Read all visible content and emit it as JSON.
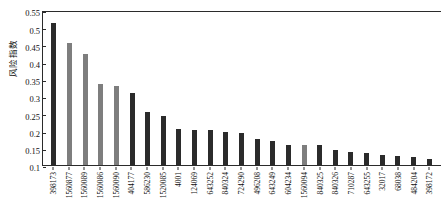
{
  "chart_data": {
    "type": "bar",
    "title": "",
    "xlabel": "",
    "ylabel": "风险指数",
    "ylim": [
      0.1,
      0.55
    ],
    "ybase": 0.1,
    "yticks": [
      0.55,
      0.5,
      0.45,
      0.4,
      0.35,
      0.3,
      0.25,
      0.2,
      0.15,
      0.1
    ],
    "ytick_labels": [
      "0.55",
      "0.5",
      "0.45",
      "0.4",
      "0.35",
      "0.3",
      "0.25",
      "0.2",
      "0.15",
      "0.1"
    ],
    "grid": false,
    "legend": null,
    "categories": [
      "398173",
      "1560877",
      "1560089",
      "1560086",
      "1560090",
      "404177",
      "586230",
      "1520085",
      "4001",
      "124069",
      "643252",
      "840324",
      "724290",
      "496208",
      "643249",
      "604234",
      "1560094",
      "840325",
      "840326",
      "710287",
      "643255",
      "32017",
      "68038",
      "484204",
      "398172"
    ],
    "values": [
      0.512,
      0.455,
      0.421,
      0.335,
      0.329,
      0.31,
      0.253,
      0.243,
      0.205,
      0.203,
      0.203,
      0.197,
      0.192,
      0.175,
      0.17,
      0.158,
      0.157,
      0.157,
      0.143,
      0.137,
      0.134,
      0.13,
      0.127,
      0.122,
      0.117
    ],
    "bar_colors": [
      "dark",
      "gray",
      "gray",
      "gray",
      "gray",
      "dark",
      "dark",
      "dark",
      "dark",
      "dark",
      "dark",
      "dark",
      "dark",
      "dark",
      "dark",
      "dark",
      "gray",
      "dark",
      "dark",
      "dark",
      "dark",
      "dark",
      "dark",
      "dark",
      "dark"
    ],
    "color_dark": "#2b2b2b",
    "color_gray": "#7e7e7e"
  }
}
